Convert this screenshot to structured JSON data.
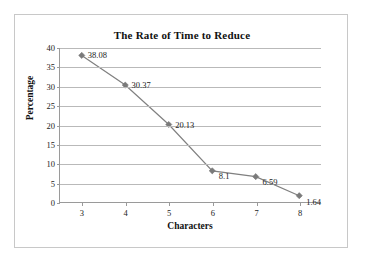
{
  "chart_data": {
    "type": "line",
    "title": "The Rate of Time to Reduce",
    "xlabel": "Characters",
    "ylabel": "Percentage",
    "categories": [
      "3",
      "4",
      "5",
      "6",
      "7",
      "8"
    ],
    "values": [
      38.08,
      30.37,
      20.13,
      8.1,
      6.59,
      1.64
    ],
    "point_labels": [
      "38.08",
      "30.37",
      "20.13",
      "8.1",
      "6.59",
      "1.64"
    ],
    "ylim": [
      0,
      40
    ],
    "ytick_labels": [
      "0",
      "5",
      "10",
      "15",
      "20",
      "25",
      "30",
      "35",
      "40"
    ],
    "ytick_values": [
      0,
      5,
      10,
      15,
      20,
      25,
      30,
      35,
      40
    ],
    "grid": "horizontal",
    "legend": "none",
    "marker": "diamond",
    "series_color": "#808080",
    "marker_color": "#7a7a7a",
    "gridline_color": "#b9b9b9",
    "axis_color": "#9a9a9a",
    "frame_color": "#c8c8c8",
    "text_color": "#222222"
  }
}
